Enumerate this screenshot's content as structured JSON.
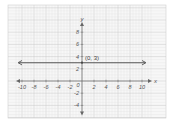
{
  "chart_data": {
    "type": "line",
    "title": "",
    "xlabel": "x",
    "ylabel": "y",
    "xlim": [
      -11,
      11.5
    ],
    "ylim": [
      -5,
      9.5
    ],
    "grid": true,
    "x_ticks": [
      -10,
      -8,
      -6,
      -4,
      -2,
      0,
      2,
      4,
      6,
      8,
      10
    ],
    "y_ticks": [
      -4,
      -2,
      2,
      4,
      6,
      8
    ],
    "x_tick_labels": [
      "-10",
      "-8",
      "-6",
      "-4",
      "-2",
      "0",
      "2",
      "4",
      "6",
      "8",
      "10"
    ],
    "y_tick_labels": [
      "-4",
      "-2",
      "2",
      "4",
      "6",
      "8"
    ],
    "series": [
      {
        "name": "y = 3",
        "type": "horizontal-line",
        "x": [
          -10.5,
          10.5
        ],
        "y": [
          3,
          3
        ],
        "arrows": "both",
        "color": "#555555"
      }
    ],
    "annotations": [
      {
        "text": "(0, 3)",
        "x": 0,
        "y": 3
      }
    ],
    "origin_label": "0",
    "colors": {
      "grid_minor": "#e2e2e2",
      "grid_major": "#c8c8c8",
      "axis": "#666666",
      "line": "#555555",
      "background": "#f7f7f7"
    }
  }
}
